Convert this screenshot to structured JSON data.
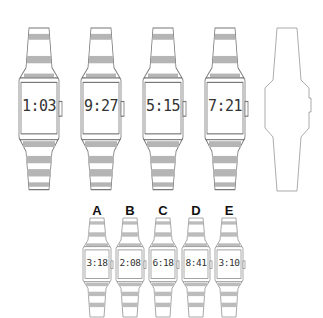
{
  "puzzle": {
    "sequence": [
      {
        "time": "1:03"
      },
      {
        "time": "9:27"
      },
      {
        "time": "5:15"
      },
      {
        "time": "7:21"
      },
      {
        "time": ""
      }
    ],
    "options": [
      {
        "letter": "A",
        "time": "3:18"
      },
      {
        "letter": "B",
        "time": "2:08"
      },
      {
        "letter": "C",
        "time": "6:18"
      },
      {
        "letter": "D",
        "time": "8:41"
      },
      {
        "letter": "E",
        "time": "3:10"
      }
    ]
  },
  "colors": {
    "outline": "#777777",
    "stripe": "#b5b5b5",
    "text": "#333333"
  }
}
